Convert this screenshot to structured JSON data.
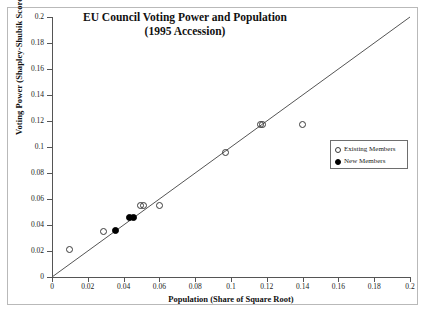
{
  "chart_data": {
    "type": "scatter",
    "title": "EU Council Voting Power and Population",
    "subtitle": "(1995 Accession)",
    "xlabel": "Population  (Share of Square Root)",
    "ylabel": "Voting Power (Shapley-Shubik Score)",
    "xlim": [
      0,
      0.2
    ],
    "ylim": [
      0,
      0.2
    ],
    "xticks": [
      "0",
      "0.02",
      "0.04",
      "0.06",
      "0.08",
      "0.1",
      "0.12",
      "0.14",
      "0.16",
      "0.18",
      "0.2"
    ],
    "xtick_values": [
      0,
      0.02,
      0.04,
      0.06,
      0.08,
      0.1,
      0.12,
      0.14,
      0.16,
      0.18,
      0.2
    ],
    "yticks": [
      "0",
      "0.02",
      "0.04",
      "0.06",
      "0.08",
      "0.1",
      "0.12",
      "0.14",
      "0.16",
      "0.18",
      "0.2"
    ],
    "ytick_values": [
      0,
      0.02,
      0.04,
      0.06,
      0.08,
      0.1,
      0.12,
      0.14,
      0.16,
      0.18,
      0.2
    ],
    "grid": false,
    "legend_position": "right",
    "reference_line": {
      "name": "45-degree line",
      "from": [
        0,
        0
      ],
      "to": [
        0.2,
        0.2
      ],
      "color": "#555555"
    },
    "series": [
      {
        "name": "Existing Members",
        "marker": "open-circle",
        "color": "#3a3a3a",
        "points": [
          {
            "x": 0.01,
            "y": 0.021
          },
          {
            "x": 0.029,
            "y": 0.035
          },
          {
            "x": 0.0495,
            "y": 0.055
          },
          {
            "x": 0.051,
            "y": 0.055
          },
          {
            "x": 0.06,
            "y": 0.055
          },
          {
            "x": 0.097,
            "y": 0.0955
          },
          {
            "x": 0.1165,
            "y": 0.117
          },
          {
            "x": 0.1175,
            "y": 0.117
          },
          {
            "x": 0.14,
            "y": 0.117
          }
        ]
      },
      {
        "name": "New Members",
        "marker": "filled-circle",
        "color": "#000000",
        "points": [
          {
            "x": 0.0355,
            "y": 0.0355
          },
          {
            "x": 0.0435,
            "y": 0.0455
          },
          {
            "x": 0.0455,
            "y": 0.0455
          }
        ]
      }
    ]
  },
  "legend": {
    "entries": [
      {
        "label": "Existing Members",
        "marker": "open-circle"
      },
      {
        "label": "New Members",
        "marker": "filled-circle"
      }
    ]
  }
}
